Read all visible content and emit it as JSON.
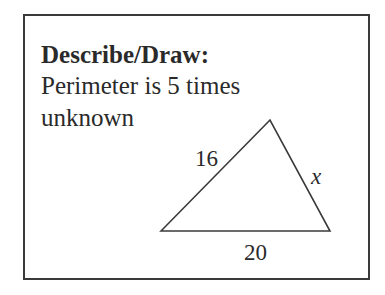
{
  "card": {
    "heading": "Describe/Draw:",
    "lines": [
      "Perimeter is 5 times",
      "unknown"
    ]
  },
  "triangle": {
    "vertices": {
      "left": [
        161,
        231
      ],
      "top": [
        270,
        120
      ],
      "right": [
        330,
        231
      ]
    },
    "labels": {
      "left_side": "16",
      "right_side": "x",
      "base": "20"
    },
    "stroke_color": "#3a3a3a"
  }
}
